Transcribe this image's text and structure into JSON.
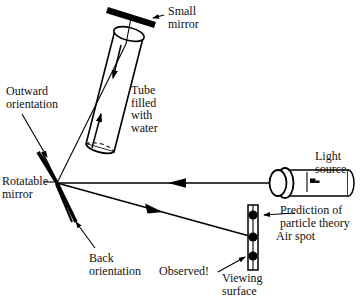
{
  "figure": {
    "background_color": "#ffffff",
    "ink_color": "#000000",
    "width": 363,
    "height": 298
  },
  "labels": {
    "small_mirror": "Small\nmirror",
    "tube_filled_with_water": "Tube\nfilled\nwith\nwater",
    "outward_orientation": "Outward\norientation",
    "rotatable_mirror": "Rotatable\nmirror",
    "back_orientation": "Back\norientation",
    "light_source": "Light\nsource",
    "prediction_of_particle_theory": "Prediction of\nparticle theory",
    "air_spot": "Air spot",
    "observed": "Observed!",
    "viewing_surface": "Viewing\nsurface"
  },
  "parts": {
    "small_mirror": {
      "name": "small-mirror",
      "shape": "thick-bar",
      "angle_deg": 20
    },
    "tube": {
      "name": "water-tube",
      "shape": "tilted-cylinder",
      "tilt_deg": 22,
      "fill": "white",
      "arrows": 2
    },
    "rotatable_mirror": {
      "name": "rotatable-mirror",
      "shape": "two-thick-strokes",
      "vertex_x": 57,
      "vertex_y": 183
    },
    "light_source": {
      "name": "light-source",
      "shape": "cylindrical-lamp",
      "switch": true
    },
    "viewing_surface": {
      "name": "viewing-surface",
      "shape": "vertical-bar",
      "spots": 3
    },
    "rays": [
      {
        "name": "incident-ray",
        "from": "light-source",
        "to": "rotatable-mirror",
        "direction": "left",
        "style": "solid"
      },
      {
        "name": "reflected-ray",
        "from": "rotatable-mirror",
        "to": "viewing-surface",
        "direction": "right",
        "style": "solid"
      }
    ],
    "spots": [
      {
        "name": "prediction-spot",
        "y": 215
      },
      {
        "name": "air-spot",
        "y": 237
      },
      {
        "name": "observed-spot",
        "y": 256
      }
    ]
  }
}
